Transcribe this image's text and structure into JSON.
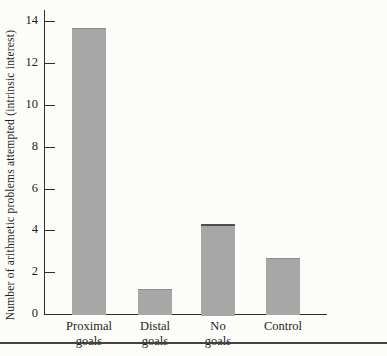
{
  "chart_data": {
    "type": "bar",
    "title": "",
    "xlabel": "",
    "ylabel": "Number of arithmetic problems attempted (intrinsic interest)",
    "categories": [
      "Proximal goals",
      "Distal goals",
      "No goals",
      "Control"
    ],
    "values": [
      13.7,
      1.2,
      4.3,
      2.7
    ],
    "ylim": [
      0,
      14
    ],
    "yticks": [
      0,
      2,
      4,
      6,
      8,
      10,
      12,
      14
    ],
    "grid": false,
    "legend": false,
    "bar_color": "#a7a7a7",
    "bar_top_edges": [
      "#8e8e8e",
      "#8e8e8e",
      "#4f4f4f",
      "#8e8e8e"
    ],
    "axis_color": "#2e2e2e",
    "background": "#fcfcf9",
    "bottom_rule_color": "#414141"
  }
}
